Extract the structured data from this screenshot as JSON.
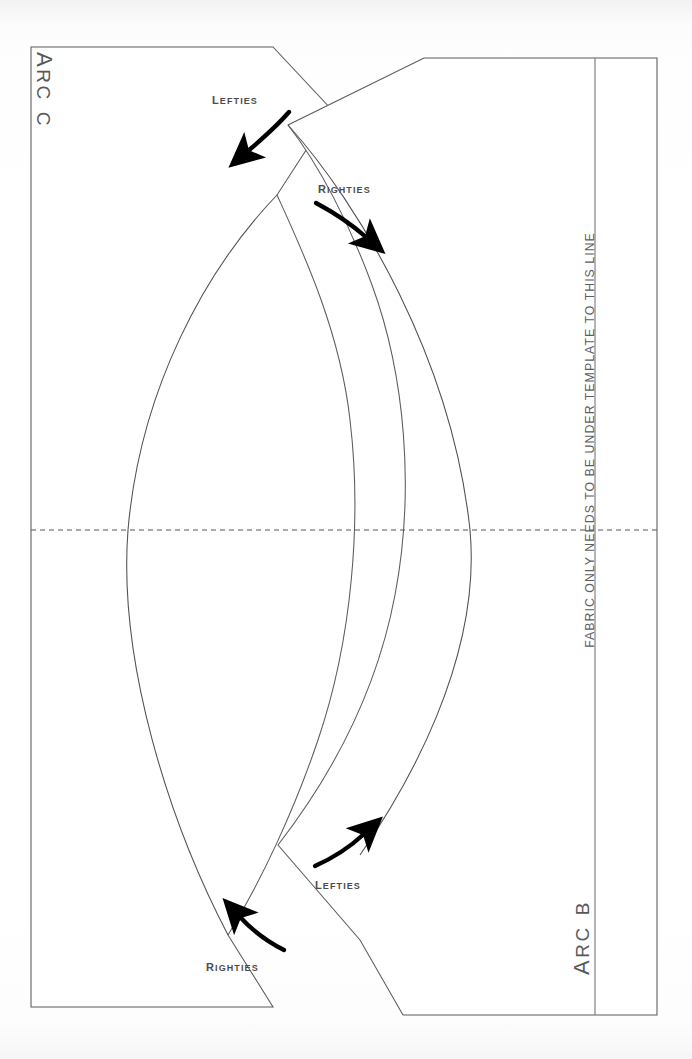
{
  "document": {
    "kind": "sewing-pattern-template",
    "background_color": "#fbfbfb",
    "line_color": "#5a5a60",
    "label_color": "#4b4b4b",
    "arrow_color": "#000000"
  },
  "pieces": {
    "top_left_piece_label": "Arc C",
    "bottom_right_piece_label": "Arc B"
  },
  "notes": {
    "fabric_line_note": "FABRIC ONLY NEEDS TO BE UNDER TEMPLATE TO THIS LINE"
  },
  "annotations": {
    "lefties_top": "Lefties",
    "righties_top": "Righties",
    "lefties_bottom": "Lefties",
    "righties_bottom": "Righties"
  },
  "icons": {
    "arrow_lefties_top": "arrow-down-left-curved",
    "arrow_righties_top": "arrow-down-right-curved",
    "arrow_lefties_bottom": "arrow-up-right-curved",
    "arrow_righties_bottom": "arrow-up-left-curved"
  },
  "geometry": {
    "sheet_left": 31,
    "sheet_right": 658,
    "sheet_top": 47,
    "sheet_bottom": 1015,
    "fabric_line_x": 595,
    "center_fold_y": 530,
    "arc_left_center_x": 128,
    "arc_right_center_x": 470
  }
}
